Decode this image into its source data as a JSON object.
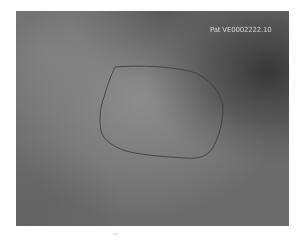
{
  "image": {
    "description": "Grayscale textured image with a hand-drawn closed contour outlining a rounded region",
    "overlay_label": "Pat VE0002222.10",
    "colors": {
      "background": "#737373",
      "center_highlight": "#8e8e8e",
      "dark_region_top_right": "#3a3a3a",
      "contour_stroke": "#3c3c3c",
      "label_text": "#e6e6e6",
      "page_background": "#ffffff"
    },
    "contour": {
      "shape": "rounded quadrilateral",
      "points_px": [
        [
          128,
          66
        ],
        [
          170,
          67
        ],
        [
          205,
          80
        ],
        [
          223,
          105
        ],
        [
          215,
          140
        ],
        [
          195,
          158
        ],
        [
          150,
          155
        ],
        [
          130,
          152
        ],
        [
          105,
          140
        ],
        [
          100,
          125
        ],
        [
          105,
          90
        ],
        [
          115,
          72
        ]
      ]
    }
  }
}
